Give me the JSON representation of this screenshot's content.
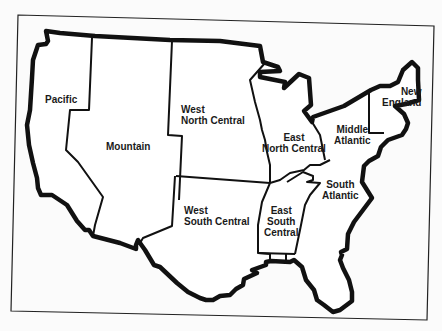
{
  "map": {
    "title": "U.S. Census Divisions",
    "colors": {
      "background": "#fbfbfb",
      "line": "#111111"
    },
    "regions": [
      {
        "id": "pacific",
        "lines": [
          "Pacific"
        ]
      },
      {
        "id": "mountain",
        "lines": [
          "Mountain"
        ]
      },
      {
        "id": "west-north-central",
        "lines": [
          "West",
          "North Central"
        ]
      },
      {
        "id": "east-north-central",
        "lines": [
          "East",
          "North Central"
        ]
      },
      {
        "id": "middle-atlantic",
        "lines": [
          "Middle",
          "Atlantic"
        ]
      },
      {
        "id": "new-england",
        "lines": [
          "New",
          "England"
        ]
      },
      {
        "id": "west-south-central",
        "lines": [
          "West",
          "South Central"
        ]
      },
      {
        "id": "east-south-central",
        "lines": [
          "East",
          "South",
          "Central"
        ]
      },
      {
        "id": "south-atlantic",
        "lines": [
          "South",
          "Atlantic"
        ]
      }
    ]
  }
}
